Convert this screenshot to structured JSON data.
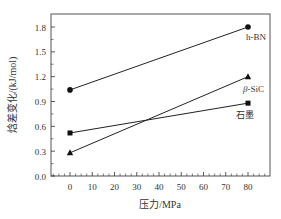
{
  "chart_data": {
    "type": "line",
    "title": "",
    "xlabel": "压力/MPa",
    "ylabel": "焓差变化/(kJ/mol)",
    "x": [
      0,
      80
    ],
    "xticks": [
      0,
      10,
      20,
      30,
      40,
      50,
      60,
      70,
      80
    ],
    "xtick_labels": [
      "0",
      "10",
      "20",
      "30",
      "40",
      "50",
      "60",
      "70",
      "80"
    ],
    "yticks": [
      0.0,
      0.3,
      0.6,
      0.9,
      1.2,
      1.5,
      1.8
    ],
    "ytick_labels": [
      "0.0",
      "0.3",
      "0.6",
      "0.9",
      "1.2",
      "1.5",
      "1.8"
    ],
    "xlim": [
      -8.5,
      89
    ],
    "ylim": [
      0.0,
      1.95
    ],
    "grid": false,
    "legend": "inline labels at right end of each series",
    "series": [
      {
        "name": "h-BN",
        "marker": "circle",
        "values": [
          1.04,
          1.8
        ]
      },
      {
        "name": "β-SiC",
        "marker": "triangle",
        "values": [
          0.28,
          1.2
        ]
      },
      {
        "name": "石墨",
        "marker": "square",
        "values": [
          0.52,
          0.88
        ]
      }
    ]
  },
  "labels": {
    "hbn": "h-BN",
    "sic_prefix": "β",
    "sic_suffix": "-SiC",
    "graphite": "石墨"
  }
}
